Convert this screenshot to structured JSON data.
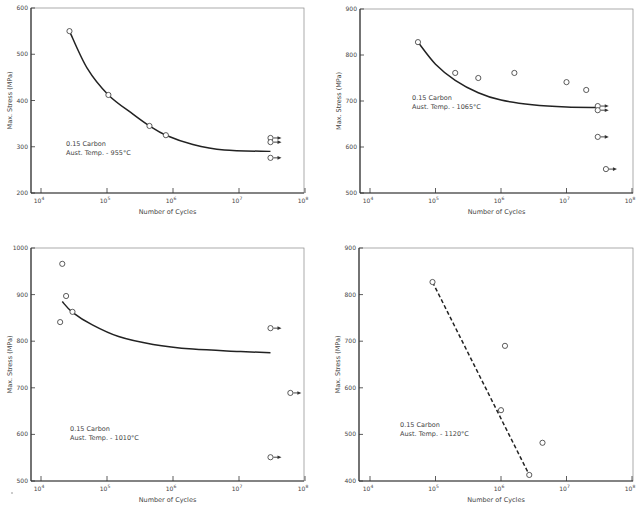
{
  "chart_data": [
    {
      "type": "scatter",
      "title": "",
      "annotation": [
        "0.15 Carbon",
        "Aust. Temp. - 955°C"
      ],
      "xlabel": "Number of Cycles",
      "ylabel": "Max. Stress (MPa)",
      "xscale": "log",
      "xlim": [
        10000,
        100000000
      ],
      "ylim": [
        200,
        600
      ],
      "xticks": [
        4,
        5,
        6,
        7,
        8
      ],
      "xtick_labels": [
        "10^4",
        "10^5",
        "10^6",
        "10^7",
        "10^8"
      ],
      "yticks": [
        200,
        300,
        400,
        500,
        600
      ],
      "grid": false,
      "legend": "none",
      "points": [
        {
          "x": 27000,
          "y": 550,
          "runout": false
        },
        {
          "x": 105000,
          "y": 412,
          "runout": false
        },
        {
          "x": 440000,
          "y": 345,
          "runout": false
        },
        {
          "x": 780000,
          "y": 325,
          "runout": false
        },
        {
          "x": 30000000,
          "y": 319,
          "runout": true
        },
        {
          "x": 30000000,
          "y": 310,
          "runout": true
        },
        {
          "x": 30000000,
          "y": 276,
          "runout": true
        }
      ],
      "fit_curve": {
        "style": "solid",
        "points": [
          [
            27000,
            550
          ],
          [
            50000,
            470
          ],
          [
            105000,
            412
          ],
          [
            250000,
            370
          ],
          [
            440000,
            345
          ],
          [
            780000,
            325
          ],
          [
            2000000,
            305
          ],
          [
            6000000,
            293
          ],
          [
            30000000,
            290
          ]
        ]
      }
    },
    {
      "type": "scatter",
      "title": "",
      "annotation": [
        "0.15 Carbon",
        "Aust. Temp. - 1065°C"
      ],
      "xlabel": "Number of Cycles",
      "ylabel": "Max. Stress (MPa)",
      "xscale": "log",
      "xlim": [
        10000,
        100000000
      ],
      "ylim": [
        500,
        900
      ],
      "xticks": [
        4,
        5,
        6,
        7,
        8
      ],
      "xtick_labels": [
        "10^4",
        "10^5",
        "10^6",
        "10^7",
        "10^8"
      ],
      "yticks": [
        500,
        600,
        700,
        800,
        900
      ],
      "grid": false,
      "legend": "none",
      "points": [
        {
          "x": 54000,
          "y": 828,
          "runout": false
        },
        {
          "x": 200000,
          "y": 761,
          "runout": false
        },
        {
          "x": 450000,
          "y": 750,
          "runout": false
        },
        {
          "x": 1600000,
          "y": 761,
          "runout": false
        },
        {
          "x": 10000000,
          "y": 741,
          "runout": false
        },
        {
          "x": 20000000,
          "y": 724,
          "runout": false
        },
        {
          "x": 30000000,
          "y": 689,
          "runout": true
        },
        {
          "x": 30000000,
          "y": 680,
          "runout": true
        },
        {
          "x": 30000000,
          "y": 622,
          "runout": true
        },
        {
          "x": 40000000,
          "y": 552,
          "runout": true
        }
      ],
      "fit_curve": {
        "style": "solid",
        "points": [
          [
            54000,
            828
          ],
          [
            100000,
            780
          ],
          [
            200000,
            745
          ],
          [
            450000,
            718
          ],
          [
            1000000,
            702
          ],
          [
            3000000,
            692
          ],
          [
            10000000,
            687
          ],
          [
            30000000,
            686
          ]
        ]
      }
    },
    {
      "type": "scatter",
      "title": "",
      "annotation": [
        "0.15 Carbon",
        "Aust. Temp. - 1010°C"
      ],
      "xlabel": "Number of Cycles",
      "ylabel": "Max. Stress (MPa)",
      "xscale": "log",
      "xlim": [
        10000,
        100000000
      ],
      "ylim": [
        500,
        1000
      ],
      "xticks": [
        4,
        5,
        6,
        7,
        8
      ],
      "xtick_labels": [
        "10^4",
        "10^5",
        "10^6",
        "10^7",
        "10^8"
      ],
      "yticks": [
        500,
        600,
        700,
        800,
        900,
        1000
      ],
      "grid": false,
      "legend": "none",
      "points": [
        {
          "x": 21000,
          "y": 966,
          "runout": false
        },
        {
          "x": 24000,
          "y": 897,
          "runout": false
        },
        {
          "x": 30000,
          "y": 863,
          "runout": false
        },
        {
          "x": 19500,
          "y": 841,
          "runout": false
        },
        {
          "x": 30000000,
          "y": 828,
          "runout": true
        },
        {
          "x": 60000000,
          "y": 689,
          "runout": true
        },
        {
          "x": 30000000,
          "y": 551,
          "runout": true
        }
      ],
      "fit_curve": {
        "style": "solid",
        "points": [
          [
            21000,
            885
          ],
          [
            30000,
            862
          ],
          [
            60000,
            835
          ],
          [
            150000,
            810
          ],
          [
            500000,
            793
          ],
          [
            2000000,
            783
          ],
          [
            10000000,
            778
          ],
          [
            30000000,
            775
          ]
        ]
      }
    },
    {
      "type": "scatter",
      "title": "",
      "annotation": [
        "0.15 Carbon",
        "Aust. Temp. - 1120°C"
      ],
      "xlabel": "Number of Cycles",
      "ylabel": "Max. Stress (MPa)",
      "xscale": "log",
      "xlim": [
        10000,
        100000000
      ],
      "ylim": [
        400,
        900
      ],
      "xticks": [
        4,
        5,
        6,
        7,
        8
      ],
      "xtick_labels": [
        "10^4",
        "10^5",
        "10^6",
        "10^7",
        "10^8"
      ],
      "yticks": [
        400,
        500,
        600,
        700,
        800,
        900
      ],
      "grid": false,
      "legend": "none",
      "points": [
        {
          "x": 90000,
          "y": 827,
          "runout": false
        },
        {
          "x": 1150000,
          "y": 690,
          "runout": false
        },
        {
          "x": 1000000,
          "y": 552,
          "runout": false
        },
        {
          "x": 4300000,
          "y": 482,
          "runout": false
        },
        {
          "x": 2700000,
          "y": 413,
          "runout": false
        }
      ],
      "fit_curve": {
        "style": "dashed",
        "points": [
          [
            90000,
            827
          ],
          [
            2700000,
            413
          ]
        ]
      }
    }
  ],
  "panels": [
    {
      "left": 31,
      "top": 8,
      "right": 304,
      "bottom": 193,
      "x0": 41,
      "decade": 66
    },
    {
      "left": 360,
      "top": 9,
      "right": 633,
      "bottom": 193,
      "x0": 370,
      "decade": 65.5
    },
    {
      "left": 31,
      "top": 248,
      "right": 304,
      "bottom": 481,
      "x0": 41,
      "decade": 66
    },
    {
      "left": 359,
      "top": 248,
      "right": 633,
      "bottom": 481,
      "x0": 370,
      "decade": 65.5
    }
  ],
  "annotation_pos": [
    [
      66,
      146
    ],
    [
      412,
      100
    ],
    [
      70,
      431
    ],
    [
      400,
      427
    ]
  ],
  "colors": {
    "line": "#222222",
    "axis": "#333333",
    "text": "#444444",
    "marker": "#333333"
  }
}
